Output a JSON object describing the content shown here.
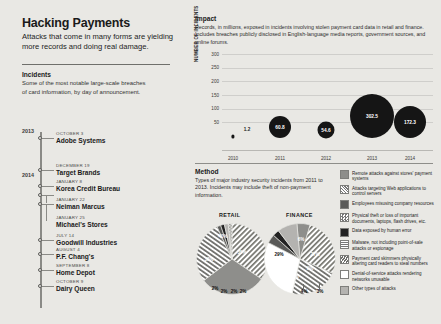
{
  "headline": "Hacking Payments",
  "dek": "Attacks that come in many forms are yielding more records and doing real damage.",
  "incidents": {
    "title": "Incidents",
    "description": "Some of the most notable large-scale breaches of card information, by day of announcement.",
    "years": [
      "2013",
      "2014"
    ],
    "events": [
      {
        "date": "OCTOBER 3",
        "name": "Adobe Systems"
      },
      {
        "date": "DECEMBER 19",
        "name": "Target Brands"
      },
      {
        "date": "JANUARY 8",
        "name": "Korea Credit Bureau"
      },
      {
        "date": "JANUARY 22",
        "name": "Neiman Marcus"
      },
      {
        "date": "JANUARY 25",
        "name": "Michael's Stores"
      },
      {
        "date": "JULY 14",
        "name": "Goodwill Industries"
      },
      {
        "date": "AUGUST 4",
        "name": "P.F. Chang's"
      },
      {
        "date": "SEPTEMBER 8",
        "name": "Home Depot"
      },
      {
        "date": "OCTOBER 9",
        "name": "Dairy Queen"
      }
    ]
  },
  "impact": {
    "title": "Impact",
    "description": "Records, in millions, exposed in incidents involving stolen payment card data in retail and finance. Includes breaches publicly disclosed in English-language media reports, government sources, and online forums."
  },
  "method": {
    "title": "Method",
    "description": "Types of major industry security incidents from 2011 to 2013. Incidents may include theft of non-payment information."
  },
  "chart_data": [
    {
      "type": "scatter",
      "title": "Impact",
      "xlabel": "",
      "ylabel": "NUMBER OF INCIDENTS",
      "x": [
        "2010",
        "2011",
        "2012",
        "2013",
        "2014"
      ],
      "values": [
        1.2,
        60.8,
        54.6,
        302.5,
        172.3
      ],
      "labels": [
        "1.2",
        "60.8",
        "54.6",
        "302.5",
        "172.3"
      ],
      "yticks": [
        "300",
        "250",
        "200",
        "150",
        "100",
        "50"
      ],
      "ylim": [
        0,
        320
      ],
      "grid": true,
      "legend": "none"
    },
    {
      "type": "pie",
      "title": "RETAIL",
      "categories": [
        "Attacks targeting Web applications to control servers",
        "Remote attacks against stores' payment systems",
        "Payment card skimmers physically altering card readers to steal numbers",
        "Employees misusing company resources",
        "Malware, not including point-of-sale attacks or espionage",
        "Denial-of-service attacks rendering networks unusable",
        "Other types of attacks"
      ],
      "values": [
        40,
        35,
        33,
        2,
        2,
        2,
        2
      ],
      "labels": [
        "40%",
        "35%",
        "33%",
        "2%",
        "2%",
        "2%",
        "2%"
      ]
    },
    {
      "type": "pie",
      "title": "FINANCE",
      "categories": [
        "Remote attacks against stores' payment systems",
        "Attacks targeting Web applications to control servers",
        "Payment card skimmers physically altering card readers to steal numbers",
        "Denial-of-service attacks rendering networks unusable",
        "Physical theft or loss of important documents, laptops, flash drives, etc.",
        "Employees misusing company resources",
        "Other types of attacks"
      ],
      "values": [
        6,
        27,
        22,
        29,
        4,
        3,
        9
      ],
      "labels": [
        "6%",
        "27%",
        "22%",
        "29%",
        "4%",
        "3%",
        "9%"
      ]
    }
  ],
  "legend": {
    "items": [
      {
        "pattern": "solid-gray",
        "text": "Remote attacks against stores' payment systems"
      },
      {
        "pattern": "diagonal-hatch",
        "text": "Attacks targeting Web applications to control servers"
      },
      {
        "pattern": "solid-dark",
        "text": "Employees misusing company resources"
      },
      {
        "pattern": "checker",
        "text": "Physical theft or loss of important documents, laptops, flash drives, etc."
      },
      {
        "pattern": "solid-black",
        "text": "Data exposed by human error"
      },
      {
        "pattern": "horizontal-hatch",
        "text": "Malware, not including point-of-sale attacks or espionage"
      },
      {
        "pattern": "wave",
        "text": "Payment card skimmers physically altering card readers to steal numbers"
      },
      {
        "pattern": "white",
        "text": "Denial-of-service attacks rendering networks unusable"
      },
      {
        "pattern": "light-gray",
        "text": "Other types of attacks"
      }
    ]
  }
}
